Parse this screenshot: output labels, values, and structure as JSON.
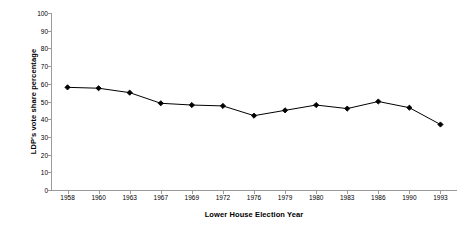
{
  "chart_data": {
    "type": "line",
    "title": "",
    "xlabel": "Lower House Election Year",
    "ylabel": "LDP's vote share percentage",
    "categories": [
      "1958",
      "1960",
      "1963",
      "1967",
      "1969",
      "1972",
      "1976",
      "1979",
      "1980",
      "1983",
      "1986",
      "1990",
      "1993"
    ],
    "values": [
      58,
      57.5,
      55,
      49,
      48,
      47.5,
      42,
      45,
      48,
      46,
      50,
      46.5,
      37
    ],
    "series": [
      {
        "name": "LDP vote share",
        "values": [
          58,
          57.5,
          55,
          49,
          48,
          47.5,
          42,
          45,
          48,
          46,
          50,
          46.5,
          37
        ]
      }
    ],
    "ylim": [
      0,
      100
    ],
    "y_ticks": [
      0,
      10,
      20,
      30,
      40,
      50,
      60,
      70,
      80,
      90,
      100
    ],
    "y_tick_labels": [
      "0",
      "10",
      "20",
      "30",
      "40",
      "50",
      "60",
      "70",
      "80",
      "90",
      "100"
    ],
    "grid": false,
    "legend": "none",
    "marker": "diamond",
    "line_color": "#000000",
    "marker_color": "#000000",
    "axis_color": "#9a9a9a",
    "background_color": "#ffffff"
  }
}
